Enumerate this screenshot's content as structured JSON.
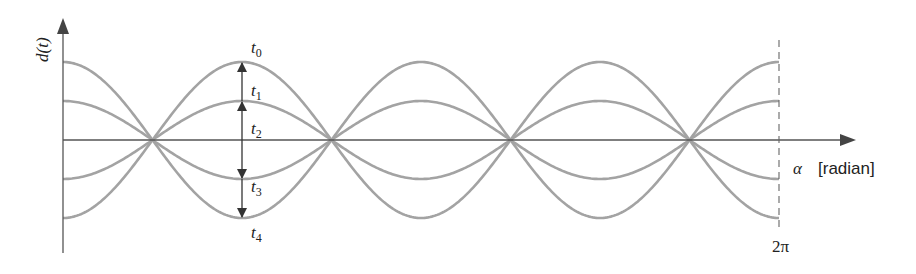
{
  "chart_data": {
    "type": "line",
    "title": "",
    "ylabel": "d(t)",
    "xlabel": "α [radian]",
    "x_tick_labels": [
      "2π"
    ],
    "xlim": [
      0,
      6.2832
    ],
    "x_label_symbol": "α",
    "x_label_unit": "[radian]",
    "ylabel_text": "d(t)",
    "end_tick": "2π",
    "series": [
      {
        "name": "t0",
        "amplitude": 1.0
      },
      {
        "name": "t1",
        "amplitude": 0.5
      },
      {
        "name": "t2",
        "amplitude": 0.0
      },
      {
        "name": "t3",
        "amplitude": -0.5
      },
      {
        "name": "t4",
        "amplitude": -1.0
      }
    ],
    "function": "d = A·cos(2α)",
    "arrow_x_position": "π/2",
    "grid": false
  },
  "labels": {
    "t0": {
      "base": "t",
      "sub": "0"
    },
    "t1": {
      "base": "t",
      "sub": "1"
    },
    "t2": {
      "base": "t",
      "sub": "2"
    },
    "t3": {
      "base": "t",
      "sub": "3"
    },
    "t4": {
      "base": "t",
      "sub": "4"
    }
  }
}
